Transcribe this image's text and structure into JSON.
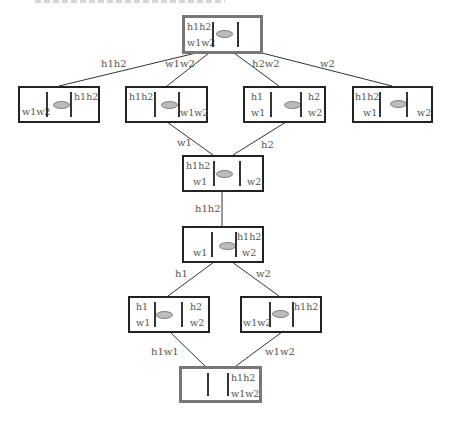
{
  "diagram": {
    "type": "lattice",
    "nodes": [
      {
        "id": "n0",
        "role": "top",
        "cells": {
          "left_top": "h1h2",
          "left_bottom": "w1w2",
          "right_top": "",
          "right_bottom": ""
        }
      },
      {
        "id": "n1",
        "cells": {
          "left_top": "",
          "left_bottom": "w1w2",
          "right_top": "h1h2",
          "right_bottom": ""
        }
      },
      {
        "id": "n2",
        "cells": {
          "left_top": "h1h2",
          "left_bottom": "",
          "right_top": "",
          "right_bottom": "w1w2"
        }
      },
      {
        "id": "n3",
        "cells": {
          "left_top": "h1",
          "left_bottom": "w1",
          "right_top": "h2",
          "right_bottom": "w2"
        }
      },
      {
        "id": "n4",
        "cells": {
          "left_top": "h1h2",
          "left_bottom": "w1",
          "right_top": "",
          "right_bottom": "w2"
        }
      },
      {
        "id": "n5",
        "cells": {
          "left_top": "h1h2",
          "left_bottom": "w1",
          "right_top": "",
          "right_bottom": "w2"
        }
      },
      {
        "id": "n6",
        "cells": {
          "left_top": "",
          "left_bottom": "w1",
          "right_top": "h1h2",
          "right_bottom": "w2"
        }
      },
      {
        "id": "n7",
        "cells": {
          "left_top": "h1",
          "left_bottom": "w1",
          "right_top": "h2",
          "right_bottom": "w2"
        }
      },
      {
        "id": "n8",
        "cells": {
          "left_top": "",
          "left_bottom": "w1w2",
          "right_top": "h1h2",
          "right_bottom": ""
        }
      },
      {
        "id": "n9",
        "role": "bottom",
        "cells": {
          "left_top": "",
          "left_bottom": "",
          "right_top": "h1h2",
          "right_bottom": "w1w2"
        }
      }
    ],
    "edges": [
      {
        "from": "n0",
        "to": "n1",
        "label": "h1h2"
      },
      {
        "from": "n0",
        "to": "n2",
        "label": "w1w2"
      },
      {
        "from": "n0",
        "to": "n3",
        "label": "h2w2"
      },
      {
        "from": "n0",
        "to": "n4",
        "label": "w2"
      },
      {
        "from": "n2",
        "to": "n5",
        "label": "w1"
      },
      {
        "from": "n3",
        "to": "n5",
        "label": "h2"
      },
      {
        "from": "n5",
        "to": "n6",
        "label": "h1h2"
      },
      {
        "from": "n6",
        "to": "n7",
        "label": "h1"
      },
      {
        "from": "n6",
        "to": "n8",
        "label": "w2"
      },
      {
        "from": "n7",
        "to": "n9",
        "label": "h1w1"
      },
      {
        "from": "n8",
        "to": "n9",
        "label": "w1w2"
      }
    ]
  }
}
